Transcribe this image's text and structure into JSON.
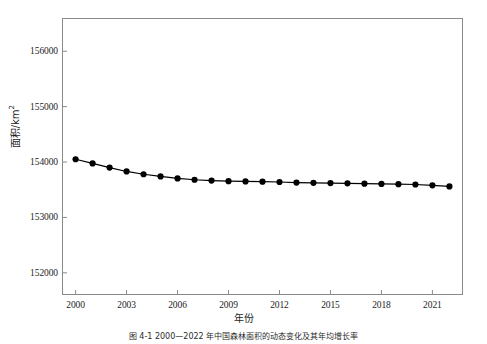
{
  "figure": {
    "caption": "图 4-1  2000—2022 年中国森林面积的动态变化及其年均增长率",
    "background_color": "#ffffff",
    "frame_color": "#8a8a8a"
  },
  "chart_data": {
    "type": "line",
    "title": "",
    "xlabel": "年份",
    "ylabel": "面积/km",
    "ylabel_unit_sup": "2",
    "xlim": [
      1999.2,
      2022.8
    ],
    "ylim": [
      151600,
      156600
    ],
    "grid": false,
    "legend": null,
    "series_color": "#000000",
    "marker": "filled-circle",
    "marker_size": 3.1,
    "line_width": 1.2,
    "y_ticks": [
      152000,
      153000,
      154000,
      155000,
      156000
    ],
    "y_tick_labels": [
      "152000",
      "153000",
      "154000",
      "155000",
      "156000"
    ],
    "x_ticks": [
      2000,
      2003,
      2006,
      2009,
      2012,
      2015,
      2018,
      2021
    ],
    "x_tick_labels": [
      "2000",
      "2003",
      "2006",
      "2009",
      "2012",
      "2015",
      "2018",
      "2021"
    ],
    "x": [
      2000,
      2001,
      2002,
      2003,
      2004,
      2005,
      2006,
      2007,
      2008,
      2009,
      2010,
      2011,
      2012,
      2013,
      2014,
      2015,
      2016,
      2017,
      2018,
      2019,
      2020,
      2021,
      2022
    ],
    "values": [
      154050,
      153975,
      153900,
      153830,
      153780,
      153740,
      153705,
      153680,
      153665,
      153655,
      153650,
      153645,
      153640,
      153630,
      153625,
      153620,
      153615,
      153610,
      153605,
      153600,
      153595,
      153580,
      153560
    ],
    "series": [
      {
        "name": "面积",
        "values": [
          154050,
          153975,
          153900,
          153830,
          153780,
          153740,
          153705,
          153680,
          153665,
          153655,
          153650,
          153645,
          153640,
          153630,
          153625,
          153620,
          153615,
          153610,
          153605,
          153600,
          153595,
          153580,
          153560
        ]
      }
    ]
  }
}
